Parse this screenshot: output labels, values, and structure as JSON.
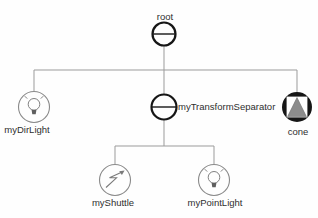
{
  "diagram": {
    "kind": "scene-graph-tree",
    "colors": {
      "background": "#fefefe",
      "connector": "#9b9b9b",
      "separator_stroke": "#161616",
      "light_node_stroke": "#8a8a8a",
      "cone_fill": "#161616",
      "cone_triangle": "#8c8c8c",
      "text": "#2e2e2e"
    },
    "nodes": [
      {
        "id": "root",
        "label": "root",
        "type": "separator",
        "icon": "separator-icon"
      },
      {
        "id": "myDirLight",
        "label": "myDirLight",
        "type": "directional-light",
        "icon": "lightbulb-icon"
      },
      {
        "id": "myTransformSeparator",
        "label": "myTransformSeparator",
        "type": "transform-separator",
        "icon": "separator-icon"
      },
      {
        "id": "cone",
        "label": "cone",
        "type": "shape-cone",
        "icon": "cone-icon"
      },
      {
        "id": "myShuttle",
        "label": "myShuttle",
        "type": "shuttle",
        "icon": "zigzag-arrow-icon"
      },
      {
        "id": "myPointLight",
        "label": "myPointLight",
        "type": "point-light",
        "icon": "lightbulb-icon"
      }
    ],
    "edges": [
      [
        "root",
        "myDirLight"
      ],
      [
        "root",
        "myTransformSeparator"
      ],
      [
        "root",
        "cone"
      ],
      [
        "myTransformSeparator",
        "myShuttle"
      ],
      [
        "myTransformSeparator",
        "myPointLight"
      ]
    ]
  }
}
